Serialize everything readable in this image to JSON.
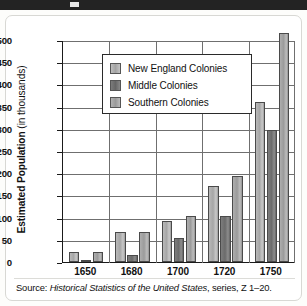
{
  "figure": {
    "source_prefix": "Source:",
    "source_title": "Historical Statistics of the United States",
    "source_suffix": ", series, Z 1–20."
  },
  "chart_data": {
    "type": "bar",
    "title": "",
    "xlabel": "",
    "ylabel_bold": "Estimated Population",
    "ylabel_rest": " (in thousands)",
    "ylim": [
      0,
      500
    ],
    "ytick_step": 50,
    "grid": true,
    "legend_position": "top-left-inside",
    "categories": [
      "1650",
      "1680",
      "1700",
      "1720",
      "1750"
    ],
    "yticks": [
      "0",
      "50",
      "100",
      "150",
      "200",
      "250",
      "300",
      "350",
      "400",
      "450",
      "500"
    ],
    "series": [
      {
        "name": "New England Colonies",
        "color": "#b0b0b0",
        "values": [
          23,
          68,
          93,
          171,
          360
        ]
      },
      {
        "name": "Middle Colonies",
        "color": "#6e6e6e",
        "values": [
          2,
          15,
          53,
          103,
          298
        ]
      },
      {
        "name": "Southern Colonies",
        "color": "#a5a5a5",
        "values": [
          23,
          68,
          104,
          193,
          515
        ]
      }
    ]
  }
}
